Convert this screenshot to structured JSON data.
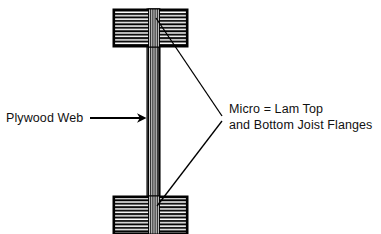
{
  "diagram": {
    "type": "cross-section",
    "background_color": "#ffffff",
    "ink_color": "#000000",
    "labels": {
      "web": {
        "text": "Plywood Web",
        "pointer": "arrow-right",
        "target": "plywood-web"
      },
      "flanges": {
        "line1": "Micro = Lam Top",
        "line2": "and Bottom Joist Flanges",
        "pointer": "two-leader-lines",
        "targets": [
          "top-flange",
          "bottom-flange"
        ]
      }
    },
    "parts": {
      "top_flange": {
        "name": "Micro-Lam Top Flange",
        "x": 113,
        "y": 9,
        "width": 75,
        "height": 38,
        "hatch": "horizontal-laminations",
        "lamination_count": 11
      },
      "bottom_flange": {
        "name": "Micro-Lam Bottom Joist Flange",
        "x": 113,
        "y": 196,
        "width": 75,
        "height": 38,
        "hatch": "horizontal-laminations",
        "lamination_count": 11
      },
      "web": {
        "name": "Plywood Web",
        "x": 147,
        "y": 9,
        "width": 13,
        "height": 225,
        "hatch": "vertical-plies",
        "ply_count": 7
      }
    },
    "leaders": {
      "web_arrow": {
        "x1": 90,
        "y1": 118,
        "x2": 146,
        "y2": 118
      },
      "top_leader": {
        "x1": 222,
        "y1": 116,
        "x2": 156,
        "y2": 18
      },
      "bottom_leader": {
        "x1": 222,
        "y1": 121,
        "x2": 157,
        "y2": 206
      }
    }
  }
}
